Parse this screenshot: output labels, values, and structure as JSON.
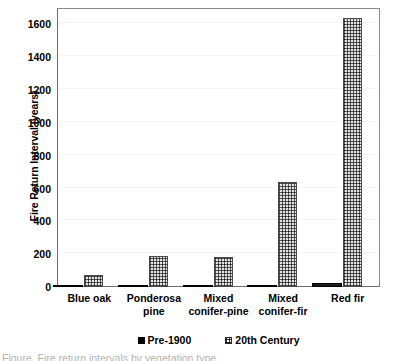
{
  "chart_data": {
    "type": "bar",
    "title": "",
    "xlabel": "",
    "ylabel": "Fire Return Interval (years)",
    "categories": [
      "Blue oak",
      "Ponderosa pine",
      "Mixed conifer-pine",
      "Mixed conifer-fir",
      "Red fir"
    ],
    "category_lines": [
      [
        "Blue oak"
      ],
      [
        "Ponderosa",
        "pine"
      ],
      [
        "Mixed",
        "conifer-pine"
      ],
      [
        "Mixed",
        "conifer-fir"
      ],
      [
        "Red fir"
      ]
    ],
    "series": [
      {
        "name": "Pre-1900",
        "values": [
          5,
          10,
          8,
          14,
          26
        ],
        "color": "#000000",
        "fill": "solid"
      },
      {
        "name": "20th Century",
        "values": [
          75,
          190,
          180,
          640,
          1640
        ],
        "color": "#e2e2e2",
        "fill": "dotted-grid"
      }
    ],
    "ylim": [
      0,
      1700
    ],
    "y_ticks": [
      0,
      200,
      400,
      600,
      800,
      1000,
      1200,
      1400,
      1600
    ],
    "y_tick_labels": [
      "0",
      "200",
      "400",
      "600",
      "800",
      "1000",
      "1200",
      "1400",
      "1600"
    ],
    "grid": true,
    "grid_axis": "y",
    "legend_position": "bottom-center",
    "legend_entries": [
      "Pre-1900",
      "20th Century"
    ]
  },
  "caption_sliver": "Figure. Fire return intervals by vegetation type."
}
